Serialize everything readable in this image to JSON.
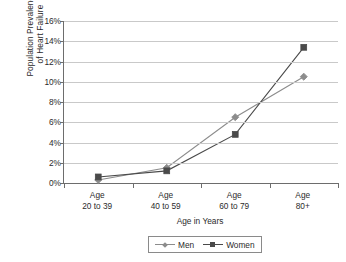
{
  "chart_data": {
    "type": "line",
    "title": "",
    "subtitle": "",
    "xlabel": "Age in Years",
    "ylabel": "Population Prevalence of Heart Failure",
    "ylabel_line1": "Population Prevalence",
    "ylabel_line2": "of Heart Failure",
    "categories": [
      "Age 20 to 39",
      "Age 40 to 59",
      "Age 60 to 79",
      "Age 80+"
    ],
    "category_lines": [
      [
        "Age",
        "20 to 39"
      ],
      [
        "Age",
        "40 to 59"
      ],
      [
        "Age",
        "60 to 79"
      ],
      [
        "Age",
        "80+"
      ]
    ],
    "series": [
      {
        "name": "Men",
        "marker": "diamond",
        "color": "#8c8c8c",
        "values": [
          0.3,
          1.5,
          6.5,
          10.5
        ]
      },
      {
        "name": "Women",
        "marker": "square",
        "color": "#4a4a4a",
        "values": [
          0.6,
          1.2,
          4.8,
          13.4
        ]
      }
    ],
    "ylim": [
      0,
      16
    ],
    "ytick_values": [
      0,
      2,
      4,
      6,
      8,
      10,
      12,
      14,
      16
    ],
    "ytick_labels": [
      "0%",
      "2%",
      "4%",
      "6%",
      "8%",
      "10%",
      "12%",
      "14%",
      "16%"
    ],
    "grid": true,
    "grid_axis": "y",
    "legend_position": "bottom",
    "value_suffix": "%"
  },
  "style": {
    "background": "#ffffff",
    "axis_color": "#6d6d6d",
    "grid_color": "#c9c9c9",
    "text_color": "#2b2b2b",
    "legend_border": "#8a8a8a"
  }
}
